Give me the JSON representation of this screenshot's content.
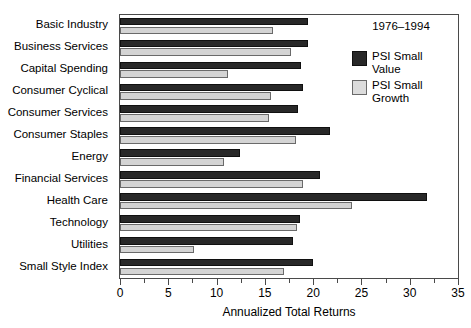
{
  "chart_data": {
    "type": "bar",
    "orientation": "horizontal",
    "title": "",
    "xlabel": "Annualized Total Returns",
    "ylabel": "",
    "xlim": [
      0,
      35
    ],
    "xticks": [
      0,
      5,
      10,
      15,
      20,
      25,
      30,
      35
    ],
    "xtick_labels": [
      "0",
      "5",
      "10",
      "15",
      "20",
      "25",
      "30",
      "35"
    ],
    "minor_ticks_per_interval": 1,
    "grid": false,
    "legend_position": "top-right",
    "period": "1976–1994",
    "categories": [
      "Basic Industry",
      "Business Services",
      "Capital Spending",
      "Consumer Cyclical",
      "Consumer Services",
      "Consumer Staples",
      "Energy",
      "Financial Services",
      "Health Care",
      "Technology",
      "Utilities",
      "Small Style Index"
    ],
    "series": [
      {
        "name": "PSI Small Value",
        "legend_label": "PSI Small\nValue",
        "color": "#282828",
        "values": [
          19.5,
          19.5,
          18.7,
          19.0,
          18.4,
          21.7,
          12.4,
          20.7,
          31.8,
          18.6,
          17.9,
          20.0
        ]
      },
      {
        "name": "PSI Small Growth",
        "legend_label": "PSI Small\nGrowth",
        "color": "#d4d4d4",
        "values": [
          15.8,
          17.7,
          11.2,
          15.6,
          15.4,
          18.2,
          10.8,
          19.0,
          24.0,
          18.3,
          7.7,
          17.0
        ]
      }
    ]
  }
}
